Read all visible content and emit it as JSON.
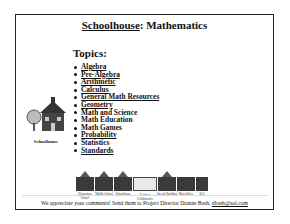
{
  "header": {
    "title_brand": "Schoolhouse",
    "title_rest": ": Mathematics"
  },
  "topics": {
    "heading": "Topics:",
    "items": [
      {
        "label": "Algebra",
        "linked": true
      },
      {
        "label": "Pre-Algebra",
        "linked": true
      },
      {
        "label": "Arithmetic",
        "linked": true
      },
      {
        "label": "Calculus",
        "linked": true
      },
      {
        "label": "General Math Resources",
        "linked": true
      },
      {
        "label": "Geometry",
        "linked": true
      },
      {
        "label": "Math and Science",
        "linked": false
      },
      {
        "label": "Math Education",
        "linked": false
      },
      {
        "label": "Math Games",
        "linked": false
      },
      {
        "label": "Probability",
        "linked": true
      },
      {
        "label": "Statistics",
        "linked": false
      },
      {
        "label": "Standards",
        "linked": true
      }
    ]
  },
  "logo": {
    "icon": "schoolhouse-icon",
    "label": "Schoolhouse"
  },
  "nav_strip": {
    "tiles": [
      {
        "label": "Elementary School"
      },
      {
        "label": "Middle School"
      },
      {
        "label": "Schoolhouse"
      },
      {
        "label": "Teachers' Collaborative"
      },
      {
        "label": "Special Building"
      },
      {
        "label": "Main Office"
      },
      {
        "label": "Bell"
      }
    ]
  },
  "footer": {
    "text": "We appreciate your comments! Send them to Project Director Dianne Bash, ",
    "email": "dbash@aol.com"
  }
}
